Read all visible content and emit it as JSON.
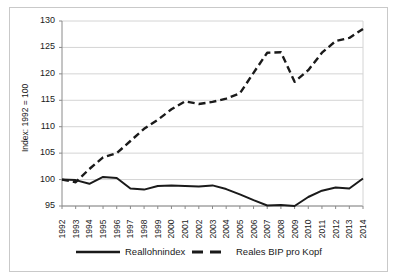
{
  "chart_data": {
    "type": "line",
    "title": "",
    "xlabel": "",
    "ylabel": "Index: 1992 = 100",
    "ylim": [
      95,
      130
    ],
    "yticks": [
      95,
      100,
      105,
      110,
      115,
      120,
      125,
      130
    ],
    "grid": true,
    "legend_position": "bottom",
    "categories": [
      1992,
      1993,
      1994,
      1995,
      1996,
      1997,
      1998,
      1999,
      2000,
      2001,
      2002,
      2003,
      2004,
      2005,
      2006,
      2007,
      2008,
      2009,
      2010,
      2011,
      2012,
      2013,
      2014
    ],
    "x_tick_labels": [
      "1992",
      "1993",
      "1994",
      "1995",
      "1996",
      "1997",
      "1998",
      "1999",
      "2000",
      "2001",
      "2002",
      "2003",
      "2004",
      "2005",
      "2006",
      "2007",
      "2008",
      "2009",
      "2010",
      "2011",
      "2012",
      "2013",
      "2014"
    ],
    "series": [
      {
        "name": "Reallohnindex",
        "style": "solid",
        "color": "#1a1a1a",
        "values": [
          100.0,
          99.9,
          99.2,
          100.5,
          100.3,
          98.3,
          98.1,
          98.8,
          98.9,
          98.8,
          98.7,
          98.9,
          98.2,
          97.2,
          96.1,
          95.1,
          95.2,
          95.0,
          96.7,
          97.9,
          98.5,
          98.3,
          100.2
        ]
      },
      {
        "name": "Reales BIP pro Kopf",
        "style": "dashed",
        "color": "#1a1a1a",
        "values": [
          100.0,
          99.5,
          102.0,
          104.2,
          105.0,
          107.3,
          109.6,
          111.3,
          113.3,
          114.8,
          114.3,
          114.7,
          115.3,
          116.3,
          120.2,
          124.0,
          124.1,
          118.5,
          120.7,
          124.0,
          126.2,
          126.8,
          128.5
        ]
      }
    ]
  },
  "legend": {
    "items": [
      {
        "label": "Reallohnindex",
        "style": "solid"
      },
      {
        "label": "Reales BIP pro Kopf",
        "style": "dashed"
      }
    ]
  }
}
